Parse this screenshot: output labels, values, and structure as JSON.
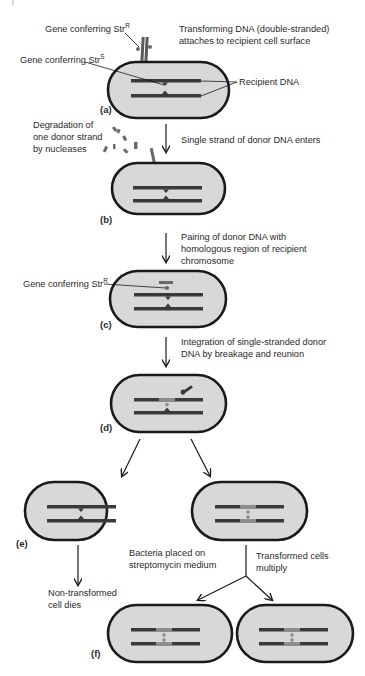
{
  "diagram": {
    "type": "process-flow",
    "topic": "Bacterial transformation with streptomycin resistance",
    "colors": {
      "cell_fill": "#d8d8d8",
      "cell_outline": "#1a1a1a",
      "recipient_dna": "#3a3a3a",
      "donor_dna": "#6a6a6a",
      "integrated_segment": "#8c8c8c",
      "text": "#2a2a2a",
      "arrow": "#1a1a1a"
    },
    "labels": {
      "gene_strR_base": "Gene conferring Str",
      "gene_strR_sup": "R",
      "gene_strS_base": "Gene conferring Str",
      "gene_strS_sup": "S",
      "recipient_dna": "Recipient DNA",
      "transforming_line1": "Transforming DNA (double-stranded)",
      "transforming_line2": "attaches to recipient cell surface",
      "degradation_line1": "Degradation of",
      "degradation_line2": "one donor strand",
      "degradation_line3": "by nucleases",
      "single_strand": "Single strand of donor DNA enters",
      "pairing_line1": "Pairing of donor DNA with",
      "pairing_line2": "homologous region of recipient",
      "pairing_line3": "chromosome",
      "gene_strR_c_base": "Gene conferring Str",
      "gene_strR_c_sup": "R",
      "integration_line1": "Integration of single-stranded donor",
      "integration_line2": "DNA by breakage and reunion",
      "streptomycin_line1": "Bacteria placed on",
      "streptomycin_line2": "streptomycin medium",
      "nontransformed_line1": "Non-transformed",
      "nontransformed_line2": "cell dies",
      "multiply_line1": "Transformed cells",
      "multiply_line2": "multiply"
    },
    "panels": {
      "a": "(a)",
      "b": "(b)",
      "c": "(c)",
      "d": "(d)",
      "e": "(e)",
      "f": "(f)"
    },
    "steps": [
      {
        "panel": "(a)",
        "description": "Transforming DNA (double-stranded) attaches to recipient cell surface"
      },
      {
        "panel": "(b)",
        "description": "Single strand of donor DNA enters; one donor strand degraded by nucleases"
      },
      {
        "panel": "(c)",
        "description": "Pairing of donor DNA with homologous region of recipient chromosome"
      },
      {
        "panel": "(d)",
        "description": "Integration of single-stranded donor DNA by breakage and reunion"
      },
      {
        "panel": "(e)",
        "description": "Bacteria placed on streptomycin medium; non-transformed cell dies"
      },
      {
        "panel": "(f)",
        "description": "Transformed cells multiply"
      }
    ]
  }
}
